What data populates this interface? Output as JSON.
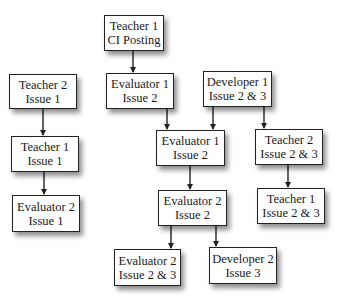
{
  "diagram": {
    "title": "",
    "nodes": [
      {
        "id": "n1",
        "line1": "Teacher 1",
        "line2": "CI Posting"
      },
      {
        "id": "n2",
        "line1": "Teacher 2",
        "line2": "Issue 1"
      },
      {
        "id": "n3",
        "line1": "Evaluator 1",
        "line2": "Issue 2"
      },
      {
        "id": "n4",
        "line1": "Developer 1",
        "line2": "Issue 2 & 3"
      },
      {
        "id": "n5",
        "line1": "Teacher 1",
        "line2": "Issue 1"
      },
      {
        "id": "n6",
        "line1": "Evaluator 1",
        "line2": "Issue 2"
      },
      {
        "id": "n7",
        "line1": "Teacher 2",
        "line2": "Issue 2 & 3"
      },
      {
        "id": "n8",
        "line1": "Evaluator 2",
        "line2": "Issue 1"
      },
      {
        "id": "n9",
        "line1": "Evaluator 2",
        "line2": "Issue 2"
      },
      {
        "id": "n10",
        "line1": "Teacher 1",
        "line2": "Issue 2 & 3"
      },
      {
        "id": "n11",
        "line1": "Evaluator 2",
        "line2": "Issue 2 & 3"
      },
      {
        "id": "n12",
        "line1": "Developer 2",
        "line2": "Issue 3"
      }
    ],
    "edges": [
      {
        "from": "Teacher 1 CI Posting",
        "to": "Evaluator 1 Issue 2"
      },
      {
        "from": "Teacher 2 Issue 1",
        "to": "Teacher 1 Issue 1"
      },
      {
        "from": "Teacher 1 Issue 1",
        "to": "Evaluator 2 Issue 1"
      },
      {
        "from": "Evaluator 1 Issue 2",
        "to": "Evaluator 1 Issue 2 (second)"
      },
      {
        "from": "Developer 1 Issue 2 & 3",
        "to": "Evaluator 1 Issue 2 (second)"
      },
      {
        "from": "Developer 1 Issue 2 & 3",
        "to": "Teacher 2 Issue 2 & 3"
      },
      {
        "from": "Teacher 2 Issue 2 & 3",
        "to": "Teacher 1 Issue 2 & 3"
      },
      {
        "from": "Evaluator 1 Issue 2 (second)",
        "to": "Evaluator 2 Issue 2"
      },
      {
        "from": "Evaluator 2 Issue 2",
        "to": "Evaluator 2 Issue 2 & 3"
      },
      {
        "from": "Evaluator 2 Issue 2",
        "to": "Developer 2 Issue 3"
      }
    ],
    "colors": {
      "line": "#222222",
      "box_fill": "#ffffff",
      "text": "#1a1a1a"
    }
  }
}
